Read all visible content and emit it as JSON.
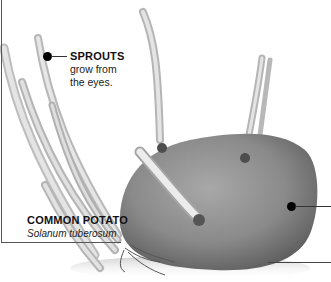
{
  "image": {
    "subject": "sprouting potato",
    "style": "grayscale photograph with annotation callouts"
  },
  "annotations": {
    "sprouts": {
      "title": "SPROUTS",
      "line1": "grow from",
      "line2": "the eyes."
    },
    "potato": {
      "title": "COMMON POTATO",
      "scientific_name": "Solanum tuberosum"
    }
  },
  "colors": {
    "callout_dot": "#000000",
    "leader_line": "#333333",
    "text": "#111111"
  }
}
